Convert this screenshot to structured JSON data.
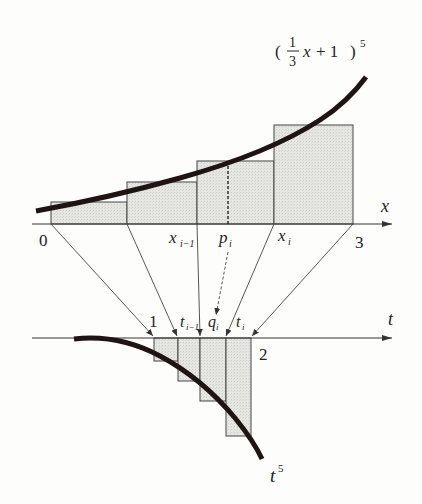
{
  "diagram": {
    "upper": {
      "function_label": {
        "open_paren": "(",
        "numerator": "1",
        "denominator": "3",
        "variable": "x",
        "plus_one": "+ 1",
        "close_paren": ")",
        "exponent": "5"
      },
      "axis_label": "x",
      "tick_labels": {
        "start": "0",
        "x_prev": "x",
        "x_prev_sub": "i−1",
        "p": "p",
        "p_sub": "i",
        "x_i": "x",
        "x_i_sub": "i",
        "end": "3"
      }
    },
    "lower": {
      "axis_label": "t",
      "tick_labels": {
        "start": "1",
        "t_prev": "t",
        "t_prev_sub": "i−1",
        "q": "q",
        "q_sub": "i",
        "t_i": "t",
        "t_i_sub": "i",
        "end": "2"
      },
      "function_label": {
        "base": "t",
        "exponent": "5"
      }
    },
    "colors": {
      "fill": "#e4e4e0",
      "stroke": "#3a3a3a",
      "curve": "#1e1412",
      "background": "#fdfdfb"
    }
  }
}
